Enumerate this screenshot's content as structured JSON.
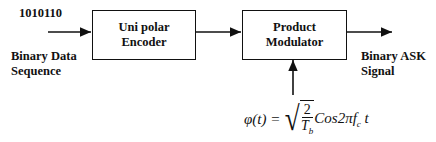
{
  "input": {
    "bits": "1010110",
    "label_line1": "Binary Data",
    "label_line2": "Sequence"
  },
  "blocks": [
    {
      "id": "encoder",
      "line1": "Uni polar",
      "line2": "Encoder"
    },
    {
      "id": "modulator",
      "line1": "Product",
      "line2": "Modulator"
    }
  ],
  "output": {
    "label_line1": "Binary ASK",
    "label_line2": "Signal"
  },
  "carrier": {
    "lhs": "φ(t) =",
    "num": "2",
    "den": "T",
    "den_sub": "b",
    "func": "Cos2πf",
    "func_sub": "c",
    "var": "t"
  }
}
